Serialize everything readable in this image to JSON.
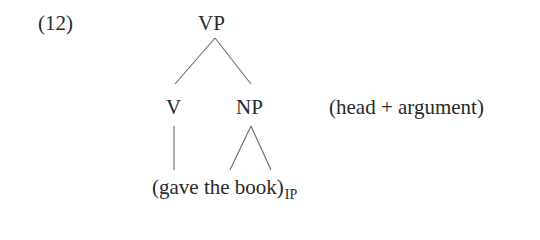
{
  "example": {
    "number": "(12)",
    "tree": {
      "root": "VP",
      "children": [
        {
          "label": "V",
          "branch": "line"
        },
        {
          "label": "NP",
          "branch": "triangle"
        }
      ],
      "terminal": {
        "text": "(gave the book)",
        "subscript": "IP"
      }
    },
    "annotation": "(head + argument)"
  }
}
